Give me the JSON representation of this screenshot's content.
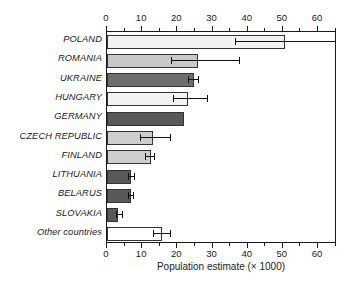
{
  "chart_data": {
    "type": "bar",
    "orientation": "horizontal",
    "title": "",
    "xlabel": "Population estimate (× 1000)",
    "ylabel": "",
    "xlim": [
      0,
      65.4
    ],
    "xticks": [
      0,
      10,
      20,
      30,
      40,
      50,
      60
    ],
    "xtick_labels": [
      "0",
      "10",
      "20",
      "30",
      "40",
      "50",
      "60"
    ],
    "minor_ticks": [
      5,
      15,
      25,
      35,
      45,
      55,
      65
    ],
    "grid": false,
    "legend": null,
    "axes_positions": [
      "top",
      "bottom"
    ],
    "categories": [
      "POLAND",
      "ROMANIA",
      "UKRAINE",
      "HUNGARY",
      "GERMANY",
      "CZECH REPUBLIC",
      "FINLAND",
      "LITHUANIA",
      "BELARUS",
      "SLOVAKIA",
      "Other countries"
    ],
    "values": [
      50.5,
      26.0,
      24.6,
      22.9,
      22.0,
      13.2,
      12.4,
      6.9,
      6.8,
      3.2,
      15.5
    ],
    "error_low": [
      36.5,
      18.3,
      22.9,
      18.9,
      null,
      9.4,
      10.9,
      6.0,
      5.9,
      2.6,
      13.1
    ],
    "error_high": [
      65.4,
      37.4,
      25.9,
      28.3,
      null,
      18.0,
      13.5,
      7.6,
      7.4,
      4.3,
      17.9
    ],
    "error_note": "POLAND upper error bound extends beyond the plotted axis range (clipped at 65.4)",
    "bar_colors": [
      "#f2f2f2",
      "#c8c8c8",
      "#6e6e6e",
      "#f2f2f2",
      "#595959",
      "#cdcdcd",
      "#cdcdcd",
      "#595959",
      "#595959",
      "#595959",
      "#ffffff"
    ],
    "bar_edge_color": "#333333",
    "error_bar_color": "#111111",
    "axis_color": "#1a1a1a",
    "background_color": "#ffffff"
  }
}
